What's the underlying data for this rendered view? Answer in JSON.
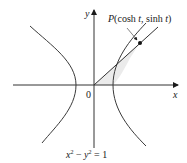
{
  "figure": {
    "axes": {
      "x_label": "x",
      "y_label": "y",
      "origin_label": "0"
    },
    "point": {
      "name": "P",
      "coords_text": "(cosh t, sinh t)",
      "label_P": "P",
      "label_open": "(cosh ",
      "label_t1": "t",
      "label_mid": ", sinh ",
      "label_t2": "t",
      "label_close": ")"
    },
    "equation": {
      "x": "x",
      "sup1": "2",
      "minus": " − ",
      "y": "y",
      "sup2": "2",
      "rest": " = 1"
    },
    "colors": {
      "curve": "#3a3a3a",
      "shaded_region": "#e6e6e6",
      "text": "#1a1a1a"
    }
  }
}
